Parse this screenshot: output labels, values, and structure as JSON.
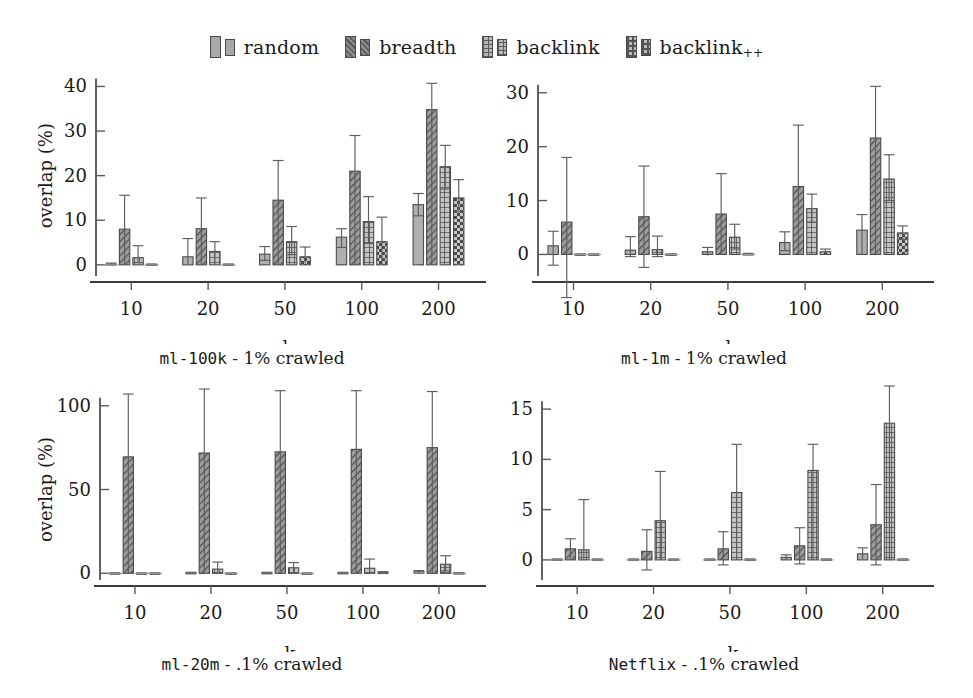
{
  "figure": {
    "legend": [
      {
        "label": "random",
        "sub": "",
        "icon": "legend-swatch-solid-gray",
        "pattern": "solid",
        "color": "#9a9a9a"
      },
      {
        "label": "breadth",
        "sub": "",
        "icon": "legend-swatch-diagonal",
        "pattern": "diagonal",
        "color": "#6e6e6e"
      },
      {
        "label": "backlink",
        "sub": "",
        "icon": "legend-swatch-grid",
        "pattern": "grid",
        "color": "#d2d2d2"
      },
      {
        "label": "backlink",
        "sub": "++",
        "icon": "legend-swatch-dots",
        "pattern": "dots",
        "color": "#d2d2d2"
      }
    ]
  },
  "chart_data": [
    {
      "id": "ml-100k",
      "type": "bar",
      "title": "ml-100k - 1% crawled",
      "title_mono": "ml-100k",
      "title_rest": " - 1% crawled",
      "xlabel": "k",
      "ylabel": "overlap (%)",
      "categories": [
        "10",
        "20",
        "50",
        "100",
        "200"
      ],
      "yticks": [
        0,
        10,
        20,
        30,
        40
      ],
      "ylim": [
        -2.5,
        41
      ],
      "grid": false,
      "legend_position": "figure-top",
      "series": [
        {
          "name": "random",
          "values": [
            0.2,
            1.8,
            2.4,
            6.2,
            13.5
          ],
          "err_low": [
            0.0,
            0.2,
            1.0,
            3.9,
            11.0
          ],
          "err_high": [
            0.4,
            5.9,
            4.1,
            8.1,
            16.0
          ]
        },
        {
          "name": "breadth",
          "values": [
            8.0,
            8.1,
            14.5,
            21.0,
            34.8
          ],
          "err_low": [
            0.0,
            0.0,
            0.0,
            0.0,
            0.0
          ],
          "err_high": [
            15.6,
            15.0,
            23.4,
            29.0,
            40.7
          ]
        },
        {
          "name": "backlink",
          "values": [
            1.6,
            3.0,
            5.2,
            9.7,
            22.0
          ],
          "err_low": [
            0.5,
            0.2,
            2.3,
            4.8,
            17.0
          ],
          "err_high": [
            4.3,
            5.2,
            8.6,
            15.3,
            26.8
          ]
        },
        {
          "name": "backlink++",
          "values": [
            0.1,
            0.1,
            1.8,
            5.2,
            15.0
          ],
          "err_low": [
            0.0,
            0.0,
            0.3,
            0.0,
            11.9
          ],
          "err_high": [
            0.2,
            0.2,
            4.0,
            10.7,
            19.1
          ]
        }
      ]
    },
    {
      "id": "ml-1m",
      "type": "bar",
      "title": "ml-1m - 1% crawled",
      "title_mono": "ml-1m",
      "title_rest": " - 1% crawled",
      "xlabel": "k",
      "ylabel": "",
      "categories": [
        "10",
        "20",
        "50",
        "100",
        "200"
      ],
      "yticks": [
        0,
        10,
        20,
        30
      ],
      "ylim": [
        -4,
        32
      ],
      "grid": false,
      "legend_position": "figure-top",
      "series": [
        {
          "name": "random",
          "values": [
            1.6,
            0.8,
            0.5,
            2.2,
            4.5
          ],
          "err_low": [
            -2.0,
            -0.4,
            -0.2,
            0.7,
            0.0
          ],
          "err_high": [
            4.3,
            3.3,
            1.3,
            4.2,
            7.4
          ]
        },
        {
          "name": "breadth",
          "values": [
            6.0,
            7.0,
            7.5,
            12.6,
            21.6
          ],
          "err_low": [
            -8.0,
            -2.4,
            0.0,
            0.0,
            0.0
          ],
          "err_high": [
            18.0,
            16.4,
            15.0,
            24.0,
            31.2
          ]
        },
        {
          "name": "backlink",
          "values": [
            0.05,
            0.9,
            3.2,
            8.5,
            14.0
          ],
          "err_low": [
            0.0,
            -0.4,
            1.0,
            6.0,
            10.0
          ],
          "err_high": [
            0.1,
            3.4,
            5.6,
            11.2,
            18.5
          ]
        },
        {
          "name": "backlink++",
          "values": [
            0.05,
            0.05,
            0.1,
            0.5,
            4.0
          ],
          "err_low": [
            0.0,
            0.0,
            0.0,
            0.0,
            2.8
          ],
          "err_high": [
            0.1,
            0.1,
            0.2,
            1.0,
            5.3
          ]
        }
      ]
    },
    {
      "id": "ml-20m",
      "type": "bar",
      "title": "ml-20m - .1% crawled",
      "title_mono": "ml-20m",
      "title_rest": " - .1% crawled",
      "xlabel": "k",
      "ylabel": "overlap (%)",
      "categories": [
        "10",
        "20",
        "50",
        "100",
        "200"
      ],
      "yticks": [
        0,
        50,
        100
      ],
      "ylim": [
        -4,
        113
      ],
      "grid": false,
      "legend_position": "figure-top",
      "series": [
        {
          "name": "random",
          "values": [
            0.15,
            0.3,
            0.3,
            0.3,
            1.0
          ],
          "err_low": [
            0.0,
            0.0,
            0.0,
            0.0,
            0.0
          ],
          "err_high": [
            0.3,
            0.6,
            0.6,
            0.6,
            1.6
          ]
        },
        {
          "name": "breadth",
          "values": [
            69.5,
            71.8,
            72.5,
            74.0,
            75.0
          ],
          "err_low": [
            0.0,
            0.0,
            0.0,
            0.0,
            0.0
          ],
          "err_high": [
            107.0,
            110.0,
            109.0,
            109.0,
            108.5
          ]
        },
        {
          "name": "backlink",
          "values": [
            0.1,
            2.5,
            3.3,
            3.0,
            5.4
          ],
          "err_low": [
            0.0,
            0.0,
            0.0,
            0.0,
            1.5
          ],
          "err_high": [
            0.2,
            6.7,
            6.4,
            8.5,
            10.5
          ]
        },
        {
          "name": "backlink++",
          "values": [
            0.1,
            0.1,
            0.1,
            0.5,
            0.2
          ],
          "err_low": [
            0.0,
            0.0,
            0.0,
            0.0,
            0.0
          ],
          "err_high": [
            0.2,
            0.2,
            0.2,
            1.0,
            0.4
          ]
        }
      ]
    },
    {
      "id": "netflix",
      "type": "bar",
      "title": "Netflix - .1% crawled",
      "title_mono": "Netflix",
      "title_rest": " - .1% crawled",
      "xlabel": "k",
      "ylabel": "",
      "categories": [
        "10",
        "20",
        "50",
        "100",
        "200"
      ],
      "yticks": [
        0,
        5,
        10,
        15
      ],
      "ylim": [
        -2,
        17.5
      ],
      "grid": false,
      "legend_position": "figure-top",
      "series": [
        {
          "name": "random",
          "values": [
            0.05,
            0.05,
            0.05,
            0.25,
            0.6
          ],
          "err_low": [
            0.0,
            0.0,
            0.0,
            0.0,
            0.1
          ],
          "err_high": [
            0.1,
            0.1,
            0.1,
            0.5,
            1.2
          ]
        },
        {
          "name": "breadth",
          "values": [
            1.1,
            0.85,
            1.1,
            1.4,
            3.5
          ],
          "err_low": [
            0.1,
            -1.0,
            -0.5,
            -0.4,
            -0.5
          ],
          "err_high": [
            2.1,
            3.0,
            2.8,
            3.2,
            7.5
          ]
        },
        {
          "name": "backlink",
          "values": [
            1.0,
            3.9,
            6.7,
            8.9,
            13.6
          ],
          "err_low": [
            0.0,
            0.0,
            0.0,
            0.0,
            0.0
          ],
          "err_high": [
            6.0,
            8.8,
            11.5,
            11.5,
            17.3
          ]
        },
        {
          "name": "backlink++",
          "values": [
            0.05,
            0.05,
            0.05,
            0.05,
            0.05
          ],
          "err_low": [
            0.0,
            0.0,
            0.0,
            0.0,
            0.0
          ],
          "err_high": [
            0.1,
            0.1,
            0.1,
            0.1,
            0.1
          ]
        }
      ]
    }
  ]
}
